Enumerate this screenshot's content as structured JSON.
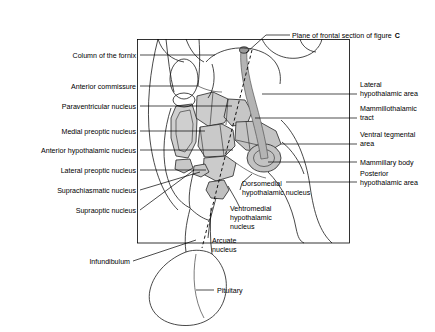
{
  "figure": {
    "panel_caption": "Plane of frontal section of figure C",
    "panel_caption_plain": "Plane of frontal section of figure",
    "panel_caption_bold": "C"
  },
  "colors": {
    "nucleus_fill": "#c9c9c9",
    "nucleus_fill_light": "#d6d6d6",
    "nucleus_fill_dark": "#b9b9b9",
    "tract_fill": "#b0b0b0",
    "outline": "#1a1a1a",
    "background": "#ffffff",
    "text": "#000000"
  },
  "labels_left": [
    {
      "id": "column-of-the-fornix",
      "text": "Column of the fornix"
    },
    {
      "id": "anterior-commissure",
      "text": "Anterior commissure"
    },
    {
      "id": "paraventricular-nucleus",
      "text": "Paraventricular nucleus"
    },
    {
      "id": "medial-preoptic-nucleus",
      "text": "Medial preoptic nucleus"
    },
    {
      "id": "anterior-hypothalamic-nucleus",
      "text": "Anterior hypothalamic nucleus"
    },
    {
      "id": "lateral-preoptic-nucleus",
      "text": "Lateral preoptic nucleus"
    },
    {
      "id": "suprachiasmatic-nucleus",
      "text": "Suprachiasmatic nucleus"
    },
    {
      "id": "supraoptic-nucleus",
      "text": "Supraoptic nucleus"
    },
    {
      "id": "infundibulum",
      "text": "Infundibulum"
    },
    {
      "id": "pituitary",
      "text": "Pituitary"
    }
  ],
  "labels_right": [
    {
      "id": "lateral-hypothalamic-area",
      "line1": "Lateral",
      "line2": "hypothalamic area"
    },
    {
      "id": "mammillothalamic-tract",
      "line1": "Mammillothalamic",
      "line2": "tract"
    },
    {
      "id": "ventral-tegmental-area",
      "line1": "Ventral tegmental",
      "line2": "area"
    },
    {
      "id": "mammillary-body",
      "line1": "Mammillary body",
      "line2": ""
    },
    {
      "id": "posterior-hypothalamic-area",
      "line1": "Posterior",
      "line2": "hypothalamic area"
    }
  ],
  "labels_center": [
    {
      "id": "dorsomedial-hypothalamic-nucleus",
      "line1": "Dorsomedial",
      "line2": "hypothalamic nucleus",
      "line3": ""
    },
    {
      "id": "ventromedial-hypothalamic-nucleus",
      "line1": "Ventromedial",
      "line2": "hypothalamic",
      "line3": "nucleus"
    },
    {
      "id": "arcuate-nucleus",
      "line1": "Arcuate",
      "line2": "nucleus",
      "line3": ""
    }
  ]
}
